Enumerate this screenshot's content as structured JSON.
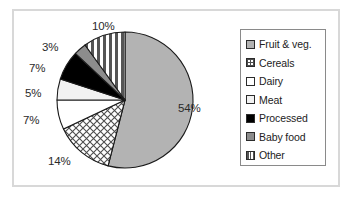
{
  "chart_data": {
    "type": "pie",
    "title": "",
    "categories": [
      "Fruit & veg.",
      "Cereals",
      "Dairy",
      "Meat",
      "Processed",
      "Baby food",
      "Other"
    ],
    "values": [
      54,
      14,
      7,
      5,
      7,
      3,
      10
    ],
    "value_labels": [
      "54%",
      "14%",
      "7%",
      "5%",
      "7%",
      "3%",
      "10%"
    ],
    "units": "percent",
    "start_angle_deg": 0,
    "direction": "clockwise",
    "legend_position": "right",
    "grid": false,
    "colors": [
      "#b3b3b3",
      "#ffffff",
      "#ffffff",
      "#f2f2f2",
      "#000000",
      "#8c8c8c",
      "#ffffff"
    ],
    "fill_patterns": [
      "solid-gray",
      "crosshatch",
      "solid-white",
      "solid-light-gray",
      "solid-black",
      "solid-gray",
      "vertical-stripes"
    ],
    "slices": [
      {
        "label": "Fruit & veg.",
        "value": 54,
        "display": "54%",
        "pattern": "solid-gray",
        "color": "#b3b3b3"
      },
      {
        "label": "Cereals",
        "value": 14,
        "display": "14%",
        "pattern": "crosshatch",
        "color": "#ffffff"
      },
      {
        "label": "Dairy",
        "value": 7,
        "display": "7%",
        "pattern": "solid-white",
        "color": "#ffffff"
      },
      {
        "label": "Meat",
        "value": 5,
        "display": "5%",
        "pattern": "solid-light-gray",
        "color": "#f2f2f2"
      },
      {
        "label": "Processed",
        "value": 7,
        "display": "7%",
        "pattern": "solid-black",
        "color": "#000000"
      },
      {
        "label": "Baby food",
        "value": 3,
        "display": "3%",
        "pattern": "solid-gray",
        "color": "#8c8c8c"
      },
      {
        "label": "Other",
        "value": 10,
        "display": "10%",
        "pattern": "vertical-stripes",
        "color": "#ffffff"
      }
    ]
  },
  "legend": {
    "items": [
      {
        "label": "Fruit & veg."
      },
      {
        "label": "Cereals"
      },
      {
        "label": "Dairy"
      },
      {
        "label": "Meat"
      },
      {
        "label": "Processed"
      },
      {
        "label": "Baby food"
      },
      {
        "label": "Other"
      }
    ]
  },
  "style": {
    "frame_color": "#d8d8d8",
    "legend_border_color": "#8a8a8a",
    "outline_color": "#1a1a1a",
    "text_color": "#222222",
    "background": "#ffffff"
  }
}
